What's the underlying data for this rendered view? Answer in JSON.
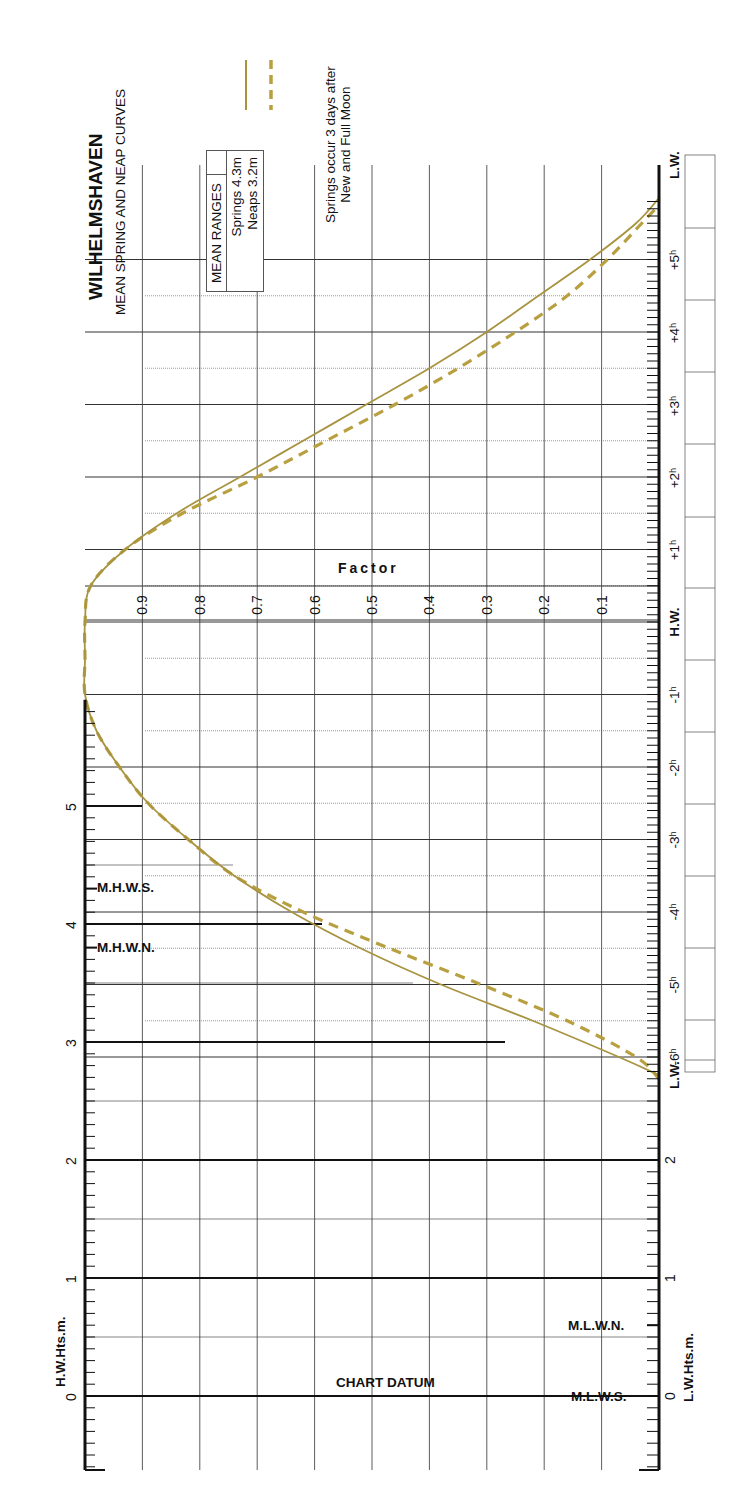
{
  "title": "WILHELMSHAVEN",
  "subtitle": "MEAN SPRING AND NEAP CURVES",
  "legend": {
    "header": "MEAN RANGES",
    "springs": "Springs 4.3m",
    "neaps": "Neaps 3.2m"
  },
  "note_line1": "Springs occur 3 days after",
  "note_line2": "New and Full Moon",
  "factor_label": "Factor",
  "chart_datum_label": "CHART DATUM",
  "hw_axis_label": "H.W.Hts.m.",
  "lw_axis_label": "L.W.Hts.m.",
  "markers": {
    "mhws": "M.H.W.S.",
    "mhwn": "M.H.W.N.",
    "mlwn": "M.L.W.N.",
    "mlws": "M.L.W.S."
  },
  "colors": {
    "springs": "#a89440",
    "neaps": "#b8a040",
    "grid": "#333333",
    "axis": "#111111"
  },
  "chart_data": {
    "type": "line",
    "orientation": "rotated 90° counter-clockwise",
    "xlabel": "Time relative to High Water (hours)",
    "ylabel": "Factor",
    "time_ticks": [
      "L.W.",
      "-6h",
      "-5h",
      "-4h",
      "-3h",
      "-2h",
      "-1h",
      "H.W.",
      "+1h",
      "+2h",
      "+3h",
      "+4h",
      "+5h",
      "L.W."
    ],
    "factor_ticks": [
      "0.1",
      "0.2",
      "0.3",
      "0.4",
      "0.5",
      "0.6",
      "0.7",
      "0.8",
      "0.9"
    ],
    "hw_height_ticks": [
      "0",
      "1",
      "2",
      "3",
      "4",
      "5"
    ],
    "lw_height_ticks": [
      "0",
      "1",
      "2"
    ],
    "ylim": [
      0,
      1
    ],
    "xlim": [
      -6.3,
      5.9
    ],
    "heights_m": {
      "MHWS": 4.3,
      "MHWN": 3.8,
      "MLWN": 0.6,
      "MLWS": 0.0
    },
    "series": [
      {
        "name": "Springs 4.3m",
        "style": "solid",
        "x": [
          -6.25,
          -6.0,
          -5.5,
          -5.0,
          -4.5,
          -4.0,
          -3.5,
          -3.0,
          -2.5,
          -2.0,
          -1.5,
          -1.0,
          -0.5,
          0.0,
          0.5,
          1.0,
          1.5,
          2.0,
          2.5,
          3.0,
          3.5,
          4.0,
          4.5,
          5.0,
          5.5,
          5.85
        ],
        "values": [
          0.0,
          0.07,
          0.22,
          0.38,
          0.52,
          0.64,
          0.74,
          0.82,
          0.89,
          0.94,
          0.98,
          1.0,
          1.0,
          1.0,
          0.99,
          0.93,
          0.84,
          0.73,
          0.62,
          0.51,
          0.4,
          0.3,
          0.21,
          0.12,
          0.04,
          0.0
        ]
      },
      {
        "name": "Neaps 3.2m",
        "style": "dashed",
        "x": [
          -6.3,
          -6.0,
          -5.5,
          -5.0,
          -4.5,
          -4.0,
          -3.5,
          -3.0,
          -2.5,
          -2.0,
          -1.5,
          -1.0,
          -0.5,
          0.0,
          0.5,
          1.0,
          1.5,
          2.0,
          2.5,
          3.0,
          3.5,
          4.0,
          4.5,
          5.0,
          5.5,
          5.75
        ],
        "values": [
          0.0,
          0.04,
          0.16,
          0.31,
          0.47,
          0.62,
          0.74,
          0.82,
          0.89,
          0.94,
          0.98,
          1.0,
          1.0,
          1.0,
          0.99,
          0.93,
          0.83,
          0.7,
          0.58,
          0.46,
          0.35,
          0.25,
          0.16,
          0.09,
          0.03,
          0.0
        ]
      }
    ]
  }
}
